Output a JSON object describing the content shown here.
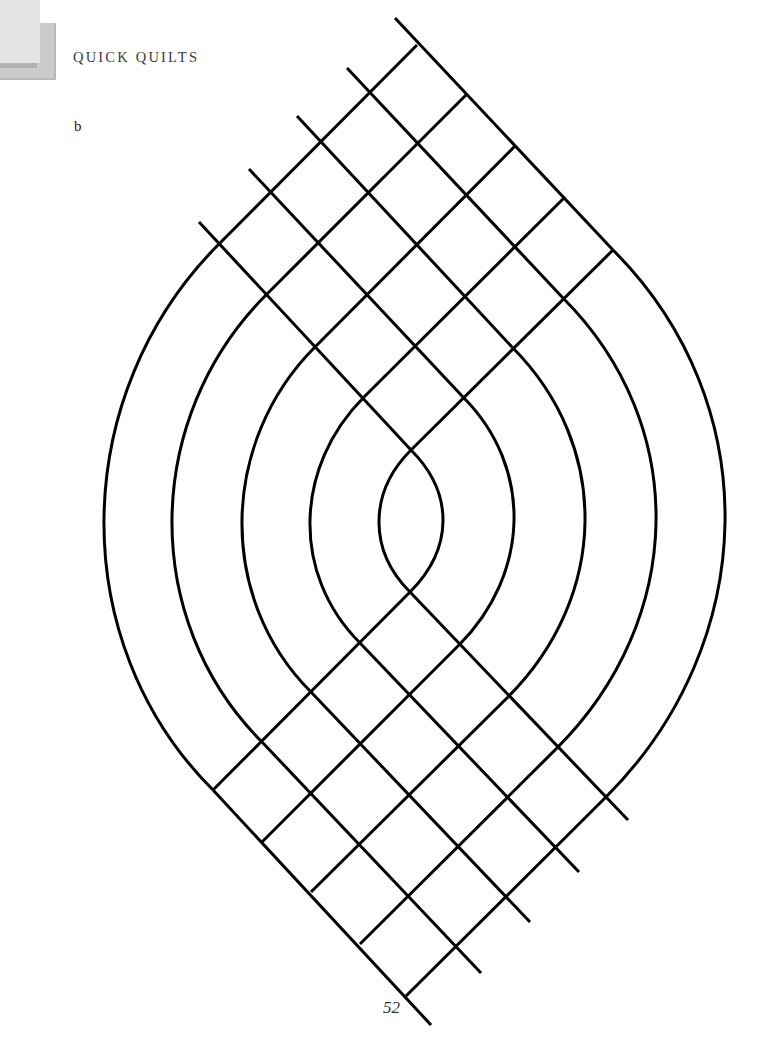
{
  "header": {
    "running_head": "QUICK QUILTS"
  },
  "figure": {
    "label": "b",
    "stroke_color": "#000000",
    "stroke_width": 3,
    "top_lattice": {
      "ne_lines": [
        {
          "from": [
            219,
            244
          ],
          "to": [
            417,
            45
          ]
        },
        {
          "from": [
            266,
            295
          ],
          "to": [
            466,
            95
          ]
        },
        {
          "from": [
            315,
            347
          ],
          "to": [
            515,
            146
          ]
        },
        {
          "from": [
            364,
            397
          ],
          "to": [
            565,
            197
          ]
        },
        {
          "from": [
            411,
            450
          ],
          "to": [
            613,
            250
          ]
        }
      ],
      "nwse_lines": [
        {
          "from": [
            395,
            18
          ],
          "to": [
            613,
            250
          ]
        },
        {
          "from": [
            347,
            68
          ],
          "to": [
            563,
            298
          ]
        },
        {
          "from": [
            297,
            116
          ],
          "to": [
            512,
            347
          ]
        },
        {
          "from": [
            249,
            169
          ],
          "to": [
            463,
            397
          ]
        },
        {
          "from": [
            199,
            222
          ],
          "to": [
            411,
            450
          ]
        }
      ]
    },
    "bottom_lattice": {
      "ne_lines": [
        {
          "from": [
            213,
            790
          ],
          "to": [
            410,
            592
          ]
        },
        {
          "from": [
            262,
            842
          ],
          "to": [
            459,
            645
          ]
        },
        {
          "from": [
            311,
            892
          ],
          "to": [
            508,
            697
          ]
        },
        {
          "from": [
            360,
            944
          ],
          "to": [
            557,
            748
          ]
        },
        {
          "from": [
            406,
            996
          ],
          "to": [
            606,
            797
          ]
        }
      ],
      "nwse_lines": [
        {
          "from": [
            410,
            592
          ],
          "to": [
            628,
            820
          ]
        },
        {
          "from": [
            360,
            643
          ],
          "to": [
            579,
            872
          ]
        },
        {
          "from": [
            311,
            692
          ],
          "to": [
            530,
            922
          ]
        },
        {
          "from": [
            262,
            742
          ],
          "to": [
            481,
            973
          ]
        },
        {
          "from": [
            213,
            790
          ],
          "to": [
            431,
            1025
          ]
        }
      ]
    },
    "left_arcs": [
      {
        "top": [
          219,
          244
        ],
        "bottom": [
          213,
          790
        ],
        "extreme_x": 104
      },
      {
        "top": [
          266,
          295
        ],
        "bottom": [
          262,
          742
        ],
        "extreme_x": 172
      },
      {
        "top": [
          315,
          347
        ],
        "bottom": [
          311,
          692
        ],
        "extreme_x": 242
      },
      {
        "top": [
          364,
          397
        ],
        "bottom": [
          360,
          643
        ],
        "extreme_x": 310
      },
      {
        "top": [
          411,
          450
        ],
        "bottom": [
          410,
          592
        ],
        "extreme_x": 379
      }
    ],
    "right_arcs": [
      {
        "top": [
          613,
          250
        ],
        "bottom": [
          606,
          797
        ],
        "extreme_x": 725
      },
      {
        "top": [
          563,
          298
        ],
        "bottom": [
          557,
          748
        ],
        "extreme_x": 656
      },
      {
        "top": [
          512,
          347
        ],
        "bottom": [
          508,
          697
        ],
        "extreme_x": 585
      },
      {
        "top": [
          463,
          397
        ],
        "bottom": [
          459,
          645
        ],
        "extreme_x": 514
      },
      {
        "top": [
          411,
          450
        ],
        "bottom": [
          410,
          592
        ],
        "extreme_x": 443
      }
    ]
  },
  "footer": {
    "page_number": "52"
  }
}
